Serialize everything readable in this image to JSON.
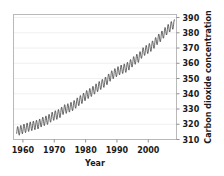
{
  "chart_data": {
    "type": "line",
    "title": "",
    "xlabel": "Year",
    "ylabel": "Carbon dioxide concentration",
    "xlim": [
      1957,
      2009
    ],
    "ylim": [
      310,
      392
    ],
    "grid": true,
    "legend": "none",
    "y_axis_side": "right",
    "xticks": [
      1960,
      1970,
      1980,
      1990,
      2000
    ],
    "yticks": [
      310,
      320,
      330,
      340,
      350,
      360,
      370,
      380,
      390
    ],
    "series": [
      {
        "name": "Monthly mean CO2 (ppm)",
        "color": "#2b2b2b",
        "description": "Keeling Curve: rising trend with annual seasonal sawtooth oscillation of about 6 ppm peak-to-trough",
        "annual_trend": {
          "x": [
            1958,
            1959,
            1960,
            1961,
            1962,
            1963,
            1964,
            1965,
            1966,
            1967,
            1968,
            1969,
            1970,
            1971,
            1972,
            1973,
            1974,
            1975,
            1976,
            1977,
            1978,
            1979,
            1980,
            1981,
            1982,
            1983,
            1984,
            1985,
            1986,
            1987,
            1988,
            1989,
            1990,
            1991,
            1992,
            1993,
            1994,
            1995,
            1996,
            1997,
            1998,
            1999,
            2000,
            2001,
            2002,
            2003,
            2004,
            2005,
            2006,
            2007,
            2008
          ],
          "values": [
            315.3,
            315.9,
            316.9,
            317.6,
            318.4,
            318.9,
            319.5,
            320.0,
            321.4,
            322.2,
            323.0,
            324.6,
            325.7,
            326.3,
            327.5,
            329.7,
            330.2,
            331.1,
            332.0,
            333.8,
            335.4,
            336.8,
            338.7,
            340.1,
            341.4,
            343.0,
            344.6,
            346.0,
            347.4,
            349.2,
            351.6,
            353.1,
            354.4,
            355.6,
            356.4,
            357.1,
            358.8,
            360.8,
            362.6,
            363.7,
            366.7,
            368.4,
            369.5,
            371.0,
            373.1,
            375.6,
            377.4,
            379.8,
            381.9,
            383.8,
            385.6
          ]
        },
        "seasonal_amplitude_ppm": 6.0,
        "seasonal_peak_month": 5,
        "seasonal_trough_month": 10
      }
    ]
  },
  "axes": {
    "x_title": "Year",
    "y_title": "Carbon dioxide concentration",
    "x_tick_labels": [
      "1960",
      "1970",
      "1980",
      "1990",
      "2000"
    ],
    "y_tick_labels": [
      "390",
      "380",
      "370",
      "360",
      "350",
      "340",
      "330",
      "320",
      "310"
    ]
  },
  "colors": {
    "series": "#2b2b2b",
    "frame": "#b9b9b9",
    "grid": "#f0f0f0",
    "text": "#1a1a1a",
    "background": "#ffffff"
  }
}
